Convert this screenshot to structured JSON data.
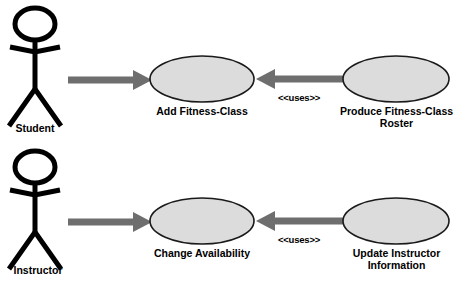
{
  "diagram": {
    "type": "uml-use-case-diagram",
    "background_color": "#ffffff",
    "colors": {
      "ellipse_fill": "#dcdcdc",
      "ellipse_stroke": "#1a1a1a",
      "arrow": "#6e6e6e",
      "actor_stroke": "#000000",
      "text": "#000000"
    },
    "actors": [
      {
        "id": "student",
        "label": "Student"
      },
      {
        "id": "instructor",
        "label": "Instructor"
      }
    ],
    "use_cases": [
      {
        "id": "add-fitness-class",
        "label": "Add Fitness-Class"
      },
      {
        "id": "produce-fitness-class-roster",
        "label": "Produce Fitness-Class\nRoster"
      },
      {
        "id": "change-availability",
        "label": "Change Availability"
      },
      {
        "id": "update-instructor-information",
        "label": "Update Instructor\nInformation"
      }
    ],
    "relationships": [
      {
        "id": "student-to-add-fitness-class",
        "from": "student",
        "to": "add-fitness-class",
        "label": ""
      },
      {
        "id": "roster-uses-add-fitness-class",
        "from": "produce-fitness-class-roster",
        "to": "add-fitness-class",
        "label": "<<uses>>"
      },
      {
        "id": "instructor-to-change-availability",
        "from": "instructor",
        "to": "change-availability",
        "label": ""
      },
      {
        "id": "update-uses-change-availability",
        "from": "update-instructor-information",
        "to": "change-availability",
        "label": "<<uses>>"
      }
    ]
  }
}
